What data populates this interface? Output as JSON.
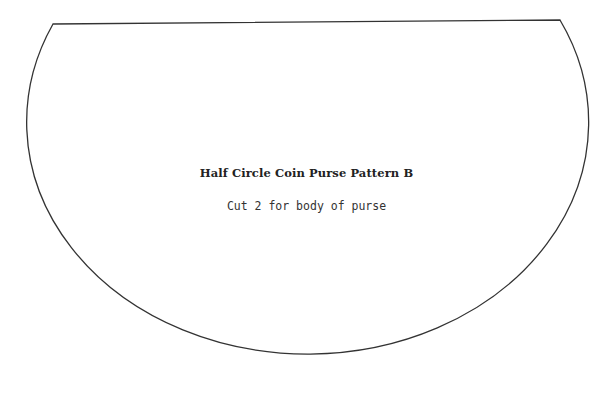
{
  "pattern": {
    "title": "Half Circle Coin Purse Pattern B",
    "instruction": "Cut 2 for body of purse",
    "outline_color": "#333333",
    "background": "#ffffff"
  }
}
